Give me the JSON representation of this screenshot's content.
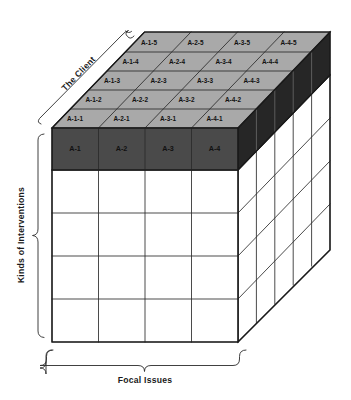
{
  "figure": {
    "type": "3d-matrix-cube-diagram",
    "background_color": "#ffffff",
    "line_color": "#1a1a1a",
    "hidden_line_color": "#6f6f6f",
    "top_face_color": "#a9a9a9",
    "front_highlight_color": "#4a4a4a",
    "side_highlight_color": "#262626",
    "front_body_color": "#ffffff",
    "side_body_color": "#ffffff"
  },
  "axes": {
    "depth": {
      "label": "The Client",
      "name": "client-axis",
      "brace": true
    },
    "vertical": {
      "label": "Kinds of Interventions",
      "name": "interventions-axis",
      "brace": true
    },
    "horizontal": {
      "label": "Focal Issues",
      "name": "issues-axis",
      "brace": true
    }
  },
  "grid": {
    "columns": 4,
    "rows": 5,
    "depth_layers": 5
  },
  "top_face": {
    "rows": [
      [
        "A-1-1",
        "A-2-1",
        "A-3-1",
        "A-4-1"
      ],
      [
        "A-1-2",
        "A-2-2",
        "A-3-2",
        "A-4-2"
      ],
      [
        "A-1-3",
        "A-2-3",
        "A-3-3",
        "A-4-3"
      ],
      [
        "A-1-4",
        "A-2-4",
        "A-3-4",
        "A-4-4"
      ],
      [
        "A-1-5",
        "A-2-5",
        "A-3-5",
        "A-4-5"
      ]
    ]
  },
  "front_face": {
    "highlighted_row": [
      "A-1",
      "A-2",
      "A-3",
      "A-4"
    ],
    "empty_rows": 4
  }
}
